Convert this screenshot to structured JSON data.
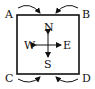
{
  "corners": {
    "a": "A",
    "b": "B",
    "c": "C",
    "d": "D"
  },
  "compass": {
    "n": "N",
    "s": "S",
    "e": "E",
    "w": "W"
  }
}
